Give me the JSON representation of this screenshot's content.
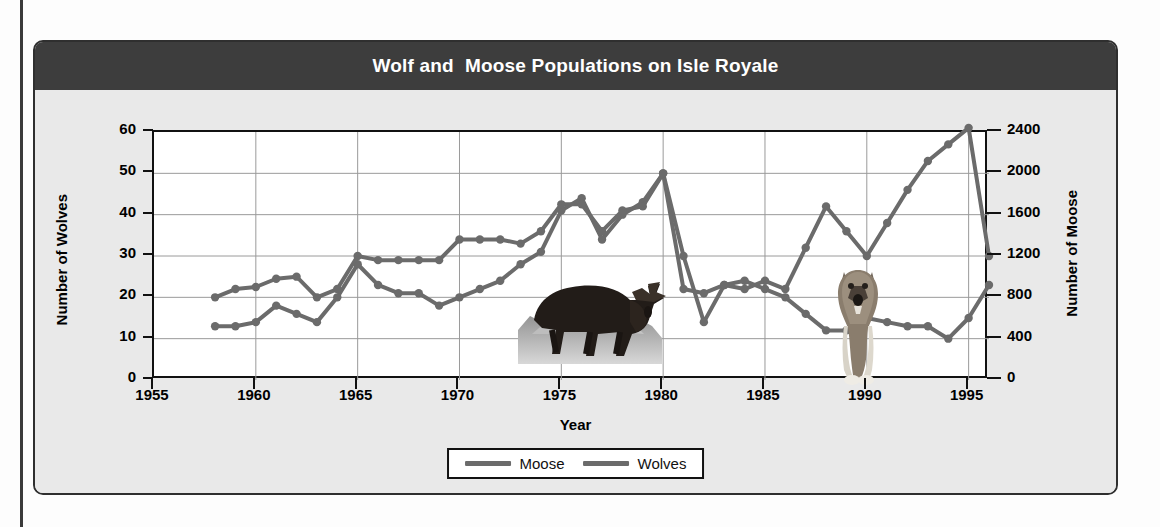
{
  "chart": {
    "title": "Wolf and  Moose Populations on Isle Royale",
    "colors": {
      "title_bar": "#3d3d3d",
      "card_bg": "#e9e9e9",
      "plot_bg": "#ffffff",
      "line": "#6b6b6b",
      "axis": "#111111",
      "grid": "#9a9a9a"
    },
    "legend": {
      "moose_label": "Moose",
      "wolves_label": "Wolves"
    },
    "art": {
      "moose_image_alt": "moose-photo",
      "wolf_image_alt": "wolf-photo"
    }
  },
  "chart_data": {
    "type": "line",
    "title": "Wolf and  Moose Populations on Isle Royale",
    "xlabel": "Year",
    "ylabel": "Number of Wolves",
    "y2label": "Number of Moose",
    "xlim": [
      1955,
      1996
    ],
    "xticks": [
      1955,
      1960,
      1965,
      1970,
      1975,
      1980,
      1985,
      1990,
      1995
    ],
    "ylim": [
      0,
      60
    ],
    "yticks": [
      0,
      10,
      20,
      30,
      40,
      50,
      60
    ],
    "y2lim": [
      0,
      2400
    ],
    "y2ticks": [
      0,
      400,
      800,
      1200,
      1600,
      2000,
      2400
    ],
    "grid": true,
    "legend_position": "bottom",
    "markers": "circle",
    "x": [
      1958,
      1959,
      1960,
      1961,
      1962,
      1963,
      1964,
      1965,
      1966,
      1967,
      1968,
      1969,
      1970,
      1971,
      1972,
      1973,
      1974,
      1975,
      1976,
      1977,
      1978,
      1979,
      1980,
      1981,
      1982,
      1983,
      1984,
      1985,
      1986,
      1987,
      1988,
      1989,
      1990,
      1991,
      1992,
      1993,
      1994,
      1995,
      1996
    ],
    "series": [
      {
        "name": "Wolves",
        "axis": "left",
        "units": "wolves",
        "values": [
          13,
          13,
          14,
          18,
          16,
          14,
          20,
          28,
          23,
          21,
          21,
          18,
          20,
          22,
          24,
          28,
          31,
          41,
          44,
          34,
          40,
          43,
          50,
          30,
          14,
          23,
          24,
          22,
          20,
          16,
          12,
          12,
          15,
          14,
          13,
          13,
          10,
          15,
          23
        ]
      },
      {
        "name": "Moose",
        "axis": "right",
        "units": "moose",
        "values": [
          800,
          880,
          900,
          980,
          1000,
          800,
          880,
          1200,
          1160,
          1160,
          1160,
          1160,
          1360,
          1360,
          1360,
          1320,
          1440,
          1700,
          1700,
          1440,
          1640,
          1680,
          2000,
          880,
          840,
          920,
          880,
          960,
          880,
          1280,
          1680,
          1440,
          1200,
          1520,
          1840,
          2120,
          2280,
          2440,
          1200
        ]
      }
    ]
  }
}
